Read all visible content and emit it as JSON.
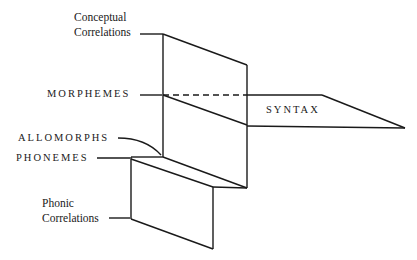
{
  "diagram": {
    "labels": {
      "conceptual_line1": "Conceptual",
      "conceptual_line2": "Correlations",
      "morphemes": "MORPHEMES",
      "syntax": "SYNTAX",
      "allomorphs": "ALLOMORPHS",
      "phonemes": "PHONEMES",
      "phonic_line1": "Phonic",
      "phonic_line2": "Correlations"
    },
    "colors": {
      "stroke": "#1a1a1a",
      "background": "#ffffff"
    }
  }
}
